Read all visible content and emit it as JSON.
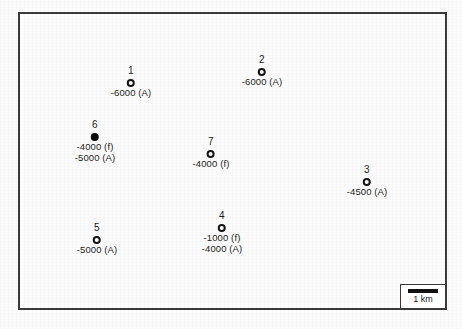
{
  "figure": {
    "type": "site-location-map",
    "caption": ""
  },
  "map": {
    "frame": {
      "border_color": "#3a3a3a"
    },
    "sites": [
      {
        "id": "1",
        "marker": "open-circle",
        "x": 131,
        "y": 81,
        "values": [
          "-6000 (A)"
        ]
      },
      {
        "id": "2",
        "marker": "open-circle",
        "x": 262,
        "y": 70,
        "values": [
          "-6000 (A)"
        ]
      },
      {
        "id": "3",
        "marker": "open-circle",
        "x": 367,
        "y": 180,
        "values": [
          "-4500 (A)"
        ]
      },
      {
        "id": "4",
        "marker": "open-circle",
        "x": 222,
        "y": 226,
        "values": [
          "-1000 (f)",
          "-4000 (A)"
        ]
      },
      {
        "id": "5",
        "marker": "open-circle",
        "x": 97,
        "y": 238,
        "values": [
          "-5000 (A)"
        ]
      },
      {
        "id": "6",
        "marker": "filled-circle",
        "x": 95,
        "y": 135,
        "values": [
          "-4000 (f)",
          "-5000 (A)"
        ]
      },
      {
        "id": "7",
        "marker": "open-circle",
        "x": 211,
        "y": 152,
        "values": [
          "-4000 (f)"
        ]
      }
    ]
  },
  "scale_bar": {
    "label": "1 km",
    "bar_color": "#111111"
  }
}
